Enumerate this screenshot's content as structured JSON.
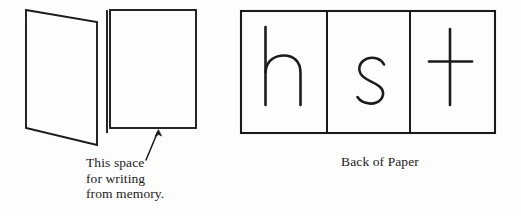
{
  "figure": {
    "kind": "folded-paper-study-diagram",
    "background_color": "#fdfdfc",
    "ink_color": "#1b1b1b",
    "left_panel": {
      "name": "folded-paper-front",
      "flap": {
        "name": "folded-flap",
        "points": "26,10 97,22 97,145 26,128"
      },
      "fold_line": {
        "name": "fold-crease",
        "x": 107,
        "y1": 10,
        "y2": 133
      },
      "writing_panel": {
        "name": "writing-space-panel",
        "x": 110,
        "y": 10,
        "width": 86,
        "height": 118
      },
      "arrow": {
        "name": "pointer-arrow",
        "from_x": 146,
        "from_y": 160,
        "to_x": 158,
        "to_y": 130
      },
      "caption_lines": [
        "This space",
        "for writing",
        "from memory."
      ]
    },
    "right_panel": {
      "name": "back-of-paper",
      "box": {
        "x": 241,
        "y": 11,
        "width": 254,
        "height": 122
      },
      "dividers_x": [
        327,
        410
      ],
      "caption": "Back of Paper",
      "cells": [
        {
          "name": "cell-letter-h",
          "letter": "h"
        },
        {
          "name": "cell-letter-s",
          "letter": "s"
        },
        {
          "name": "cell-letter-t",
          "letter": "t"
        }
      ]
    }
  }
}
